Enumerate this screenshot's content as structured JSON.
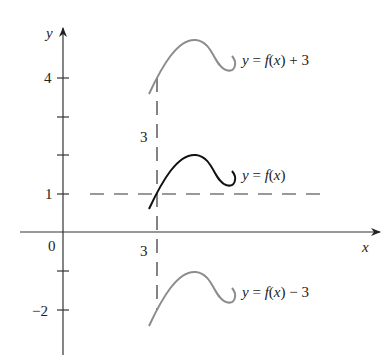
{
  "diagram": {
    "axes": {
      "x_label": "x",
      "y_label": "y",
      "origin_label": "0"
    },
    "y_ticks": [
      {
        "label": "4",
        "value": 4
      },
      {
        "label": "",
        "value": 3
      },
      {
        "label": "",
        "value": 2
      },
      {
        "label": "1",
        "value": 1
      },
      {
        "label": "",
        "value": -1
      },
      {
        "label": "−2",
        "value": -2
      }
    ],
    "x_ticks": [
      {
        "label": "3",
        "value": 3
      }
    ],
    "shift_annotation": "3",
    "curves": [
      {
        "label": "y = f(x) + 3",
        "shift": 3,
        "color": "#8c8c8c"
      },
      {
        "label": "y = f(x)",
        "shift": 0,
        "color": "#111111"
      },
      {
        "label": "y = f(x) − 3",
        "shift": -3,
        "color": "#8c8c8c"
      }
    ],
    "reference_line": {
      "y": 1,
      "style": "dashed"
    },
    "vertical_line": {
      "x": 3,
      "style": "dashed"
    }
  }
}
